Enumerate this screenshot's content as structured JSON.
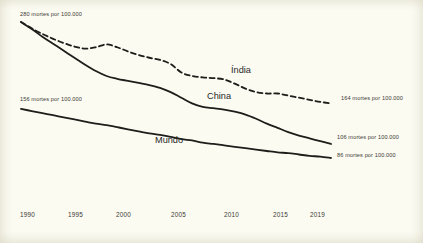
{
  "chart_data": {
    "type": "line",
    "title": "",
    "subtitle": "",
    "xlabel": "",
    "ylabel": "",
    "unit_label": "mortes por 100.000",
    "xlim": [
      1990,
      2019
    ],
    "ylim": [
      0,
      300
    ],
    "grid": false,
    "legend_position": "inline-labels",
    "x": [
      1990,
      1991,
      1992,
      1993,
      1994,
      1995,
      1996,
      1997,
      1998,
      1999,
      2000,
      2001,
      2002,
      2003,
      2004,
      2005,
      2006,
      2007,
      2008,
      2009,
      2010,
      2011,
      2012,
      2013,
      2014,
      2015,
      2016,
      2017,
      2018,
      2019
    ],
    "xticks": [
      "1990",
      "1995",
      "2000",
      "2005",
      "2010",
      "2015",
      "2019"
    ],
    "series": [
      {
        "name": "Índia",
        "style": "dashed",
        "color": "#1d1d19",
        "start_value": 280,
        "end_value": 164,
        "start_label": "280 mortes por 100.000",
        "end_label": "164 mortes por 100.000",
        "values": [
          280,
          271,
          263,
          256,
          250,
          245,
          242,
          244,
          248,
          244,
          238,
          233,
          229,
          226,
          220,
          208,
          203,
          201,
          200,
          198,
          192,
          185,
          180,
          178,
          178,
          175,
          172,
          169,
          166,
          164
        ]
      },
      {
        "name": "China",
        "style": "solid",
        "color": "#1d1d19",
        "start_value": 280,
        "end_value": 106,
        "start_label": "280 mortes por 100.000",
        "end_label": "106 mortes por 100.000",
        "values": [
          280,
          270,
          259,
          249,
          239,
          229,
          219,
          210,
          203,
          199,
          196,
          193,
          190,
          186,
          180,
          172,
          164,
          159,
          157,
          155,
          152,
          148,
          142,
          135,
          129,
          123,
          118,
          114,
          110,
          106
        ]
      },
      {
        "name": "Mundo",
        "style": "solid",
        "color": "#1d1d19",
        "start_value": 156,
        "end_value": 86,
        "start_label": "156 mortes por 100.000",
        "end_label": "86 mortes por 100.000",
        "values": [
          156,
          153,
          150,
          147,
          144,
          141,
          138,
          135,
          133,
          130,
          127,
          124,
          121,
          119,
          116,
          113,
          111,
          108,
          106,
          104,
          102,
          100,
          98,
          96,
          94,
          93,
          91,
          89,
          88,
          86
        ]
      }
    ]
  },
  "labels": {
    "india_name": "Índia",
    "china_name": "China",
    "mundo_name": "Mundo",
    "india_start": "280 mortes por 100.000",
    "india_end": "164 mortes por 100.000",
    "china_end": "106 mortes por 100.000",
    "mundo_start": "156 mortes por 100.000",
    "mundo_end": "86 mortes por 100.000"
  },
  "axis": {
    "t1990": "1990",
    "t1995": "1995",
    "t2000": "2000",
    "t2005": "2005",
    "t2010": "2010",
    "t2015": "2015",
    "t2019": "2019"
  },
  "colors": {
    "background": "#fcfbf2",
    "ink": "#1d1d19",
    "text": "#3a3a33"
  }
}
